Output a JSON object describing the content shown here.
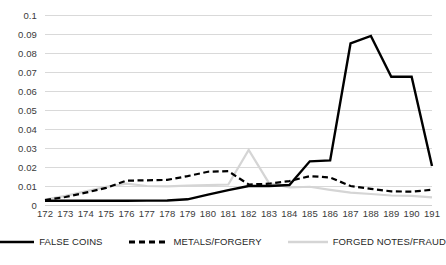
{
  "chart_data": {
    "type": "line",
    "title": "",
    "subtitle": "",
    "xlabel": "",
    "ylabel": "",
    "xlim": [
      172,
      191
    ],
    "ylim": [
      0,
      0.1
    ],
    "grid": true,
    "legend_position": "bottom",
    "y_ticks": [
      "0",
      "0.01",
      "0.02",
      "0.03",
      "0.04",
      "0.05",
      "0.06",
      "0.07",
      "0.08",
      "0.09",
      "0.1"
    ],
    "y_tick_values": [
      0,
      0.01,
      0.02,
      0.03,
      0.04,
      0.05,
      0.06,
      0.07,
      0.08,
      0.09,
      0.1
    ],
    "categories": [
      "172",
      "173",
      "174",
      "175",
      "176",
      "177",
      "178",
      "179",
      "180",
      "181",
      "182",
      "183",
      "184",
      "185",
      "186",
      "187",
      "188",
      "189",
      "190",
      "191"
    ],
    "series": [
      {
        "name": "FALSE COINS",
        "style": "solid",
        "color": "#000000",
        "width": 2.4,
        "values": [
          0.0022,
          0.0022,
          0.0022,
          0.0022,
          0.0022,
          0.0023,
          0.0024,
          0.003,
          0.0055,
          0.0078,
          0.01,
          0.01,
          0.0105,
          0.023,
          0.0235,
          0.085,
          0.089,
          0.0675,
          0.0675,
          0.0205
        ]
      },
      {
        "name": "METALS/FORGERY",
        "style": "dashed",
        "color": "#000000",
        "width": 2.2,
        "values": [
          0.0026,
          0.0042,
          0.0065,
          0.009,
          0.0128,
          0.013,
          0.0132,
          0.0152,
          0.0175,
          0.0178,
          0.0108,
          0.0112,
          0.0126,
          0.0152,
          0.0145,
          0.01,
          0.0085,
          0.0072,
          0.007,
          0.008
        ]
      },
      {
        "name": "FORGED NOTES/FRAUD",
        "style": "solid",
        "color": "#d5d5d5",
        "width": 2.2,
        "values": [
          0.0028,
          0.0048,
          0.0072,
          0.0095,
          0.0112,
          0.01,
          0.0098,
          0.0102,
          0.0105,
          0.0108,
          0.029,
          0.0115,
          0.0092,
          0.0096,
          0.008,
          0.0065,
          0.0058,
          0.005,
          0.0048,
          0.004
        ]
      }
    ]
  },
  "legend": [
    {
      "label": "FALSE COINS",
      "swatch": "solid-black-line"
    },
    {
      "label": "METALS/FORGERY",
      "swatch": "dashed-black-line"
    },
    {
      "label": "FORGED NOTES/FRAUD",
      "swatch": "solid-gray-line"
    }
  ]
}
